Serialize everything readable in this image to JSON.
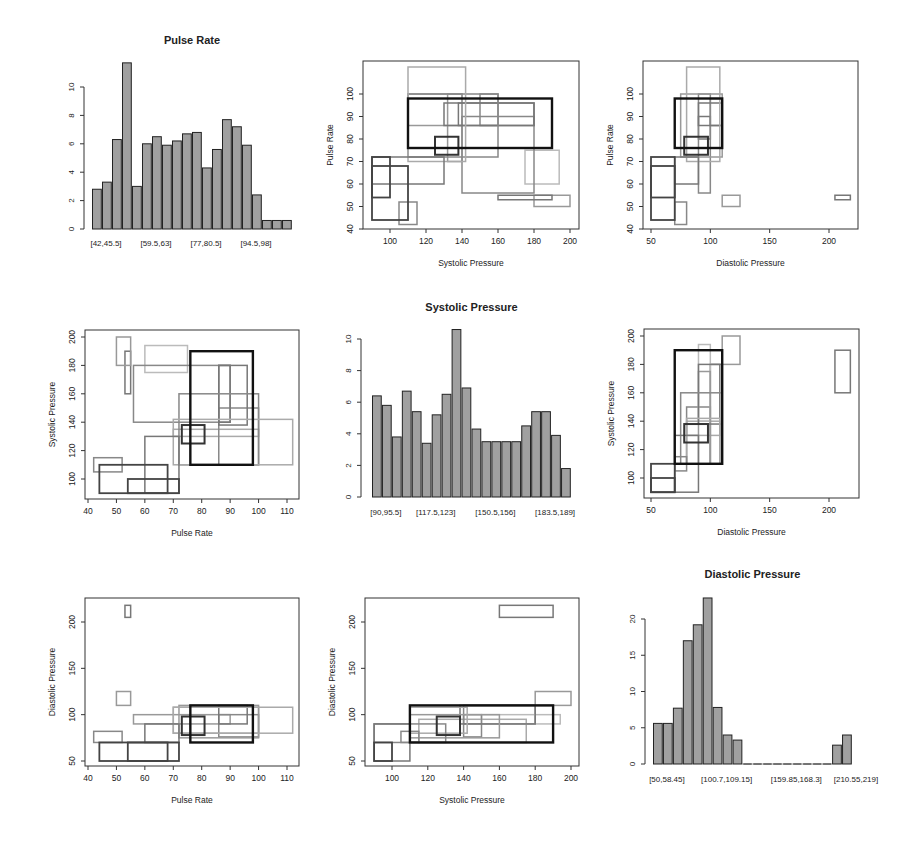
{
  "figure": {
    "layout": "3x3 scatterplot matrix of interval-valued data",
    "background": "#ffffff"
  },
  "variables": [
    "Pulse Rate",
    "Systolic Pressure",
    "Diastolic Pressure"
  ],
  "chart_data": [
    {
      "panel": "1-1",
      "type": "bar",
      "title": "Pulse Rate",
      "categories": [
        "[42,45.5]",
        "[45.5,49]",
        "[49,52.5]",
        "[52.5,56]",
        "[56,59.5]",
        "[59.5,63]",
        "[63,66.5]",
        "[66.5,70]",
        "[70,73.5]",
        "[73.5,77]",
        "[77,80.5]",
        "[80.5,84]",
        "[84,87.5]",
        "[87.5,91]",
        "[91,94.5]",
        "[94.5,98]",
        "[98,101.5]",
        "[101.5,105]",
        "[105,108.5]",
        "[108.5,112]"
      ],
      "tick_labels": [
        "[42,45.5]",
        "[59.5,63]",
        "[77,80.5]",
        "[94.5,98]"
      ],
      "values": [
        2.8,
        3.3,
        6.3,
        11.7,
        3.0,
        6.0,
        6.5,
        5.9,
        6.2,
        6.7,
        6.8,
        4.3,
        5.6,
        7.7,
        7.2,
        5.9,
        2.4,
        0.6,
        0.6,
        0.6
      ],
      "yticks": [
        0,
        2,
        4,
        6,
        8,
        10
      ],
      "ylim": [
        0,
        12
      ],
      "xlabel": "",
      "ylabel": "",
      "bar_color": "#a0a0a0",
      "frame": {
        "axis_x": 84,
        "x0": 92,
        "x1": 292,
        "y0": 229,
        "px_per_unit": 14.2,
        "title_y": 44,
        "tick_label_y": 246
      }
    },
    {
      "panel": "1-2",
      "type": "scatter",
      "subtype": "interval-rectangles",
      "xlabel": "Systolic Pressure",
      "ylabel": "Pulse Rate",
      "xticks": [
        100,
        120,
        140,
        160,
        180,
        200
      ],
      "yticks": [
        40,
        50,
        60,
        70,
        80,
        90,
        100
      ],
      "xlim": [
        85,
        205
      ],
      "ylim": [
        40,
        114
      ],
      "frame": {
        "left": 363,
        "right": 579,
        "top": 61,
        "bottom": 229,
        "xa": 100,
        "xpa": 390,
        "xb": 200,
        "xpb": 570,
        "ya": 40,
        "ypa": 229,
        "yb": 100,
        "ypb": 94
      },
      "rects": [
        [
          110,
          190,
          76,
          98,
          "#111",
          2.4
        ],
        [
          125,
          138,
          73,
          81,
          "#333",
          2
        ],
        [
          90,
          100,
          54,
          72,
          "#444",
          1.8
        ],
        [
          90,
          110,
          44,
          68,
          "#444",
          1.8
        ],
        [
          90,
          130,
          60,
          72,
          "#777",
          1.5
        ],
        [
          105,
          115,
          42,
          52,
          "#888",
          1.5
        ],
        [
          110,
          142,
          70,
          112,
          "#aaa",
          1.5
        ],
        [
          110,
          160,
          72,
          100,
          "#888",
          1.5
        ],
        [
          130,
          180,
          86,
          96,
          "#777",
          1.5
        ],
        [
          138,
          180,
          86,
          96,
          "#777",
          1.5
        ],
        [
          150,
          160,
          86,
          100,
          "#888",
          1.5
        ],
        [
          140,
          180,
          56,
          90,
          "#888",
          1.5
        ],
        [
          110,
          140,
          86,
          100,
          "#999",
          1.5
        ],
        [
          132,
          140,
          70,
          100,
          "#999",
          1.5
        ],
        [
          160,
          190,
          53,
          55,
          "#777",
          1.5
        ],
        [
          180,
          200,
          50,
          55,
          "#999",
          1.5
        ],
        [
          175,
          194,
          60,
          75,
          "#bbb",
          1.5
        ]
      ]
    },
    {
      "panel": "1-3",
      "type": "scatter",
      "subtype": "interval-rectangles",
      "xlabel": "Diastolic Pressure",
      "ylabel": "Pulse Rate",
      "xticks": [
        50,
        100,
        150,
        200
      ],
      "yticks": [
        40,
        50,
        60,
        70,
        80,
        90,
        100
      ],
      "xlim": [
        43,
        225
      ],
      "ylim": [
        40,
        114
      ],
      "frame": {
        "left": 643,
        "right": 858,
        "top": 61,
        "bottom": 229,
        "xa": 50,
        "xpa": 651,
        "xb": 200,
        "xpb": 829,
        "ya": 40,
        "ypa": 229,
        "yb": 100,
        "ypb": 94
      },
      "rects": [
        [
          70,
          110,
          76,
          98,
          "#111",
          2.4
        ],
        [
          78,
          98,
          73,
          81,
          "#333",
          2
        ],
        [
          50,
          70,
          54,
          72,
          "#444",
          1.8
        ],
        [
          50,
          70,
          44,
          68,
          "#444",
          1.8
        ],
        [
          70,
          90,
          60,
          72,
          "#777",
          1.5
        ],
        [
          70,
          80,
          42,
          52,
          "#888",
          1.5
        ],
        [
          80,
          108,
          70,
          112,
          "#aaa",
          1.5
        ],
        [
          75,
          110,
          72,
          100,
          "#999",
          1.5
        ],
        [
          90,
          110,
          86,
          96,
          "#777",
          1.5
        ],
        [
          90,
          100,
          56,
          100,
          "#888",
          1.5
        ],
        [
          100,
          110,
          86,
          98,
          "#777",
          1.5
        ],
        [
          110,
          125,
          50,
          55,
          "#999",
          1.5
        ],
        [
          205,
          218,
          53,
          55,
          "#777",
          1.5
        ],
        [
          90,
          100,
          80,
          90,
          "#777",
          1.5
        ]
      ]
    },
    {
      "panel": "2-1",
      "type": "scatter",
      "subtype": "interval-rectangles",
      "xlabel": "Pulse Rate",
      "ylabel": "Systolic Pressure",
      "xticks": [
        40,
        50,
        60,
        70,
        80,
        90,
        100,
        110
      ],
      "yticks": [
        100,
        120,
        140,
        160,
        180,
        200
      ],
      "xlim": [
        39,
        115
      ],
      "ylim": [
        85,
        205
      ],
      "frame": {
        "left": 85,
        "right": 299,
        "top": 330,
        "bottom": 499,
        "xa": 40,
        "xpa": 88,
        "xb": 110,
        "xpb": 287,
        "ya": 100,
        "ypa": 479,
        "yb": 200,
        "ypb": 337
      },
      "rects": [
        [
          76,
          98,
          110,
          190,
          "#111",
          2.4
        ],
        [
          73,
          81,
          125,
          138,
          "#333",
          2
        ],
        [
          54,
          72,
          90,
          100,
          "#444",
          1.8
        ],
        [
          44,
          68,
          90,
          110,
          "#444",
          1.8
        ],
        [
          60,
          72,
          90,
          130,
          "#777",
          1.5
        ],
        [
          42,
          52,
          105,
          115,
          "#888",
          1.5
        ],
        [
          70,
          112,
          110,
          142,
          "#aaa",
          1.5
        ],
        [
          72,
          100,
          110,
          160,
          "#888",
          1.5
        ],
        [
          86,
          96,
          138,
          180,
          "#777",
          1.5
        ],
        [
          86,
          90,
          140,
          180,
          "#777",
          1.5
        ],
        [
          86,
          100,
          110,
          150,
          "#888",
          1.5
        ],
        [
          56,
          90,
          140,
          180,
          "#888",
          1.5
        ],
        [
          50,
          55,
          180,
          200,
          "#999",
          1.5
        ],
        [
          53,
          55,
          160,
          190,
          "#777",
          1.5
        ],
        [
          60,
          75,
          175,
          194,
          "#bbb",
          1.5
        ],
        [
          70,
          100,
          130,
          135,
          "#aaa",
          1.5
        ]
      ]
    },
    {
      "panel": "2-2",
      "type": "bar",
      "title": "Systolic Pressure",
      "categories": [
        "[90,95.5]",
        "[95.5,101]",
        "[101,106.5]",
        "[106.5,112]",
        "[112,117.5]",
        "[117.5,123]",
        "[123,128.5]",
        "[128.5,134]",
        "[134,139.5]",
        "[139.5,145]",
        "[145,150.5]",
        "[150.5,156]",
        "[156,161.5]",
        "[161.5,167]",
        "[167,172.5]",
        "[172.5,178]",
        "[178,183.5]",
        "[183.5,189]",
        "[189,194.5]",
        "[194.5,200]"
      ],
      "tick_labels": [
        "[90,95.5]",
        "[117.5,123]",
        "[150.5,156]",
        "[183.5,189]"
      ],
      "values": [
        6.4,
        5.8,
        3.8,
        6.7,
        5.4,
        3.4,
        5.2,
        6.5,
        10.6,
        6.9,
        4.3,
        3.5,
        3.5,
        3.5,
        3.5,
        4.5,
        5.4,
        5.4,
        3.9,
        1.8
      ],
      "yticks": [
        0,
        2,
        4,
        6,
        8,
        10
      ],
      "ylim": [
        0,
        11
      ],
      "xlabel": "",
      "ylabel": "",
      "bar_color": "#a0a0a0",
      "frame": {
        "axis_x": 361,
        "x0": 372,
        "x1": 571,
        "y0": 497,
        "px_per_unit": 15.8,
        "title_y": 311,
        "tick_label_y": 515
      }
    },
    {
      "panel": "2-3",
      "type": "scatter",
      "subtype": "interval-rectangles",
      "xlabel": "Diastolic Pressure",
      "ylabel": "Systolic Pressure",
      "xticks": [
        50,
        100,
        150,
        200
      ],
      "yticks": [
        100,
        120,
        140,
        160,
        180,
        200
      ],
      "xlim": [
        43,
        225
      ],
      "ylim": [
        85,
        205
      ],
      "frame": {
        "left": 644,
        "right": 859,
        "top": 329,
        "bottom": 498,
        "xa": 50,
        "xpa": 651,
        "xb": 200,
        "xpb": 829,
        "ya": 100,
        "ypa": 478,
        "yb": 200,
        "ypb": 336
      },
      "rects": [
        [
          70,
          110,
          110,
          190,
          "#111",
          2.4
        ],
        [
          78,
          98,
          125,
          138,
          "#333",
          2
        ],
        [
          50,
          70,
          90,
          100,
          "#444",
          1.8
        ],
        [
          50,
          70,
          90,
          110,
          "#444",
          1.8
        ],
        [
          70,
          90,
          90,
          130,
          "#777",
          1.5
        ],
        [
          70,
          80,
          105,
          115,
          "#888",
          1.5
        ],
        [
          80,
          108,
          110,
          142,
          "#aaa",
          1.5
        ],
        [
          75,
          110,
          110,
          160,
          "#888",
          1.5
        ],
        [
          90,
          110,
          138,
          180,
          "#777",
          1.5
        ],
        [
          90,
          100,
          110,
          175,
          "#999",
          1.5
        ],
        [
          90,
          100,
          140,
          194,
          "#bbb",
          1.5
        ],
        [
          80,
          100,
          110,
          150,
          "#888",
          1.5
        ],
        [
          100,
          108,
          110,
          180,
          "#777",
          1.5
        ],
        [
          110,
          125,
          180,
          200,
          "#999",
          1.5
        ],
        [
          205,
          218,
          160,
          190,
          "#777",
          1.5
        ],
        [
          80,
          108,
          130,
          140,
          "#aaa",
          1.5
        ]
      ]
    },
    {
      "panel": "3-1",
      "type": "scatter",
      "subtype": "interval-rectangles",
      "xlabel": "Pulse Rate",
      "ylabel": "Diastolic Pressure",
      "xticks": [
        40,
        50,
        60,
        70,
        80,
        90,
        100,
        110
      ],
      "yticks": [
        50,
        100,
        150,
        200
      ],
      "xlim": [
        39,
        115
      ],
      "ylim": [
        45,
        225
      ],
      "frame": {
        "left": 85,
        "right": 299,
        "top": 598,
        "bottom": 766,
        "xa": 40,
        "xpa": 88,
        "xb": 110,
        "xpb": 287,
        "ya": 50,
        "ypa": 761,
        "yb": 200,
        "ypb": 622
      },
      "rects": [
        [
          76,
          98,
          70,
          110,
          "#111",
          2.4
        ],
        [
          73,
          81,
          78,
          98,
          "#333",
          2
        ],
        [
          54,
          72,
          50,
          70,
          "#444",
          1.8
        ],
        [
          44,
          68,
          50,
          70,
          "#444",
          1.8
        ],
        [
          60,
          72,
          70,
          90,
          "#777",
          1.5
        ],
        [
          42,
          52,
          70,
          82,
          "#888",
          1.5
        ],
        [
          70,
          112,
          80,
          108,
          "#aaa",
          1.5
        ],
        [
          72,
          100,
          75,
          110,
          "#999",
          1.5
        ],
        [
          86,
          96,
          90,
          110,
          "#777",
          1.5
        ],
        [
          86,
          100,
          76,
          100,
          "#888",
          1.5
        ],
        [
          56,
          90,
          90,
          100,
          "#999",
          1.5
        ],
        [
          50,
          55,
          110,
          125,
          "#999",
          1.5
        ],
        [
          53,
          55,
          205,
          218,
          "#777",
          1.5
        ],
        [
          70,
          100,
          80,
          108,
          "#aaa",
          1.5
        ]
      ]
    },
    {
      "panel": "3-2",
      "type": "scatter",
      "subtype": "interval-rectangles",
      "xlabel": "Systolic Pressure",
      "ylabel": "Diastolic Pressure",
      "xticks": [
        100,
        120,
        140,
        160,
        180,
        200
      ],
      "yticks": [
        50,
        100,
        150,
        200
      ],
      "xlim": [
        85,
        205
      ],
      "ylim": [
        45,
        225
      ],
      "frame": {
        "left": 365,
        "right": 579,
        "top": 598,
        "bottom": 766,
        "xa": 100,
        "xpa": 392,
        "xb": 200,
        "xpb": 571,
        "ya": 50,
        "ypa": 761,
        "yb": 200,
        "ypb": 622
      },
      "rects": [
        [
          110,
          190,
          70,
          110,
          "#111",
          2.4
        ],
        [
          125,
          138,
          78,
          98,
          "#333",
          2
        ],
        [
          90,
          100,
          50,
          70,
          "#444",
          1.8
        ],
        [
          90,
          110,
          50,
          90,
          "#777",
          1.5
        ],
        [
          90,
          130,
          70,
          90,
          "#888",
          1.5
        ],
        [
          105,
          115,
          70,
          82,
          "#888",
          1.5
        ],
        [
          110,
          142,
          80,
          108,
          "#aaa",
          1.5
        ],
        [
          110,
          160,
          75,
          100,
          "#999",
          1.5
        ],
        [
          138,
          180,
          90,
          110,
          "#777",
          1.5
        ],
        [
          140,
          150,
          76,
          100,
          "#888",
          1.5
        ],
        [
          150,
          194,
          90,
          100,
          "#bbb",
          1.5
        ],
        [
          140,
          180,
          90,
          110,
          "#888",
          1.5
        ],
        [
          160,
          190,
          205,
          218,
          "#777",
          1.5
        ],
        [
          180,
          200,
          110,
          125,
          "#999",
          1.5
        ],
        [
          115,
          175,
          70,
          95,
          "#aaa",
          1.5
        ]
      ]
    },
    {
      "panel": "3-3",
      "type": "bar",
      "title": "Diastolic Pressure",
      "categories": [
        "[50,58.45]",
        "[58.45,66.9]",
        "[66.9,75.35]",
        "[75.35,83.8]",
        "[83.8,92.25]",
        "[92.25,100.7]",
        "[100.7,109.15]",
        "[109.15,117.6]",
        "[117.6,126.05]",
        "[126.05,134.5]",
        "[134.5,142.95]",
        "[142.95,151.4]",
        "[151.4,159.85]",
        "[159.85,168.3]",
        "[168.3,176.75]",
        "[176.75,185.2]",
        "[185.2,193.65]",
        "[193.65,202.1]",
        "[202.1,210.55]",
        "[210.55,219]"
      ],
      "tick_labels": [
        "[50,58.45]",
        "[100.7,109.15]",
        "[159.85,168.3]",
        "[210.55,219]"
      ],
      "values": [
        5.6,
        5.6,
        7.7,
        17.0,
        19.2,
        22.9,
        7.8,
        4.0,
        3.3,
        0,
        0,
        0,
        0,
        0,
        0,
        0,
        0,
        0,
        2.6,
        4.0
      ],
      "yticks": [
        0,
        5,
        10,
        15,
        20
      ],
      "ylim": [
        0,
        23
      ],
      "xlabel": "",
      "ylabel": "",
      "bar_color": "#a0a0a0",
      "frame": {
        "axis_x": 645,
        "x0": 653,
        "x1": 852,
        "y0": 764,
        "px_per_unit": 7.25,
        "title_y": 578,
        "tick_label_y": 782
      }
    }
  ]
}
